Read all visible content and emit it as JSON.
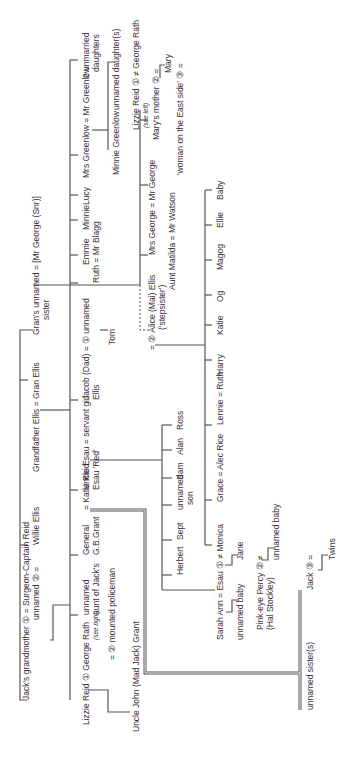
{
  "diagram": {
    "type": "family-tree",
    "orientation": "rotated -90deg (reads bottom to top)",
    "line_color": "#555555",
    "people": [
      {
        "id": "jacks_grandmother",
        "text": "Jack's grandmother ① = Surgeon-Captain Reid",
        "x": 22,
        "y": 700
      },
      {
        "id": "unnamed2",
        "text": "unnamed ② =",
        "x": 32,
        "y": 620
      },
      {
        "id": "willie",
        "text": "Willie Ellis",
        "x": 32,
        "y": 545
      },
      {
        "id": "grandfather",
        "text": "Grandfather Ellis = Gran Ellis",
        "x": 32,
        "y": 472
      },
      {
        "id": "grans_sister",
        "text": "Gran's unnamed = [Mr George (Snr)]",
        "x": 32,
        "y": 335
      },
      {
        "id": "grans_sister2",
        "text": "sister",
        "x": 42,
        "y": 320
      },
      {
        "id": "lizzie_reid",
        "text": "Lizzie Reid ① George Rath",
        "x": 82,
        "y": 725
      },
      {
        "id": "see_right",
        "text": "(see right)",
        "x": 92,
        "y": 640
      },
      {
        "id": "unnamed_aunt",
        "text": "unnamed",
        "x": 82,
        "y": 615
      },
      {
        "id": "unnamed_aunt2",
        "text": "aunt of Jack's",
        "x": 92,
        "y": 615
      },
      {
        "id": "general",
        "text": "General",
        "x": 82,
        "y": 555
      },
      {
        "id": "general2",
        "text": "G.B.Grant",
        "x": 92,
        "y": 555
      },
      {
        "id": "katie_reid",
        "text": "= Katie Reid",
        "x": 82,
        "y": 510
      },
      {
        "id": "uncle_esau",
        "text": "Uncle Esau = servant girl",
        "x": 82,
        "y": 490
      },
      {
        "id": "uncle_esau2",
        "text": "Esau 'Red'",
        "x": 92,
        "y": 490
      },
      {
        "id": "jacob",
        "text": "Jacob (Dad) = ① unnamed",
        "x": 82,
        "y": 400
      },
      {
        "id": "jacob2",
        "text": "Ellis",
        "x": 92,
        "y": 400
      },
      {
        "id": "ruth",
        "text": "Ruth = Mr Blagg",
        "x": 92,
        "y": 283
      },
      {
        "id": "emmie",
        "text": "Emmie",
        "x": 82,
        "y": 265
      },
      {
        "id": "minnie",
        "text": "Minnie",
        "x": 82,
        "y": 230
      },
      {
        "id": "lucy",
        "text": "Lucy",
        "x": 82,
        "y": 205
      },
      {
        "id": "mrs_greenlow",
        "text": "Mrs Greenlow = Mr Greenlow",
        "x": 82,
        "y": 178
      },
      {
        "id": "unmarried",
        "text": "2 unmarried",
        "x": 82,
        "y": 78
      },
      {
        "id": "unmarried2",
        "text": "daughters",
        "x": 92,
        "y": 72
      },
      {
        "id": "minnie_greenlow",
        "text": "Minnie Greenlow",
        "x": 112,
        "y": 175
      },
      {
        "id": "unnamed_daughters",
        "text": "unnamed daughter(s)",
        "x": 112,
        "y": 110
      },
      {
        "id": "mounted_policeman",
        "text": "= ② mounted policeman",
        "x": 108,
        "y": 660
      },
      {
        "id": "uncle_john",
        "text": "Uncle John (Mad Jack) Grant",
        "x": 132,
        "y": 732
      },
      {
        "id": "tom",
        "text": "Tom",
        "x": 108,
        "y": 345
      },
      {
        "id": "alice",
        "text": "= ② Alice (Mai) Ellis",
        "x": 148,
        "y": 350
      },
      {
        "id": "alice2",
        "text": "('stepsister')",
        "x": 158,
        "y": 330
      },
      {
        "id": "aunt_matilda",
        "text": "Aunt Matilda = Mr Watson",
        "x": 168,
        "y": 290
      },
      {
        "id": "mrs_george",
        "text": "Mrs George = Mr George",
        "x": 148,
        "y": 255
      },
      {
        "id": "lizzie_reid2",
        "text": "Lizzie Reid ① ≠ George Rath",
        "x": 132,
        "y": 130
      },
      {
        "id": "see_left",
        "text": "(see left)",
        "x": 142,
        "y": 128
      },
      {
        "id": "marys_mother",
        "text": "Mary's mother ② =",
        "x": 152,
        "y": 140
      },
      {
        "id": "mary",
        "text": "Mary",
        "x": 164,
        "y": 73
      },
      {
        "id": "woman_east",
        "text": "'woman on the East side' ③ =",
        "x": 176,
        "y": 175
      },
      {
        "id": "herbert",
        "text": "Herbert",
        "x": 176,
        "y": 575
      },
      {
        "id": "sept",
        "text": "Sept",
        "x": 176,
        "y": 540
      },
      {
        "id": "unnamed_son",
        "text": "unnamed",
        "x": 176,
        "y": 510
      },
      {
        "id": "unnamed_son2",
        "text": "son",
        "x": 186,
        "y": 505
      },
      {
        "id": "sam",
        "text": "Sam",
        "x": 176,
        "y": 480
      },
      {
        "id": "alan",
        "text": "Alan",
        "x": 176,
        "y": 455
      },
      {
        "id": "ross",
        "text": "Ross",
        "x": 176,
        "y": 430
      },
      {
        "id": "sarah_ann",
        "text": "Sarah Ann = Esau ① ≠ Monica",
        "x": 216,
        "y": 640
      },
      {
        "id": "unnamed_baby1",
        "text": "unnamed baby",
        "x": 236,
        "y": 640
      },
      {
        "id": "pink_eye",
        "text": "Pink-eye Percy ② ≠",
        "x": 256,
        "y": 630
      },
      {
        "id": "pink_eye2",
        "text": "(Hal Stockley)",
        "x": 266,
        "y": 630
      },
      {
        "id": "unnamed_baby2",
        "text": "unnamed baby",
        "x": 272,
        "y": 560
      },
      {
        "id": "jane",
        "text": "Jane",
        "x": 236,
        "y": 560
      },
      {
        "id": "grace",
        "text": "Grace = Alec Rice",
        "x": 216,
        "y": 502
      },
      {
        "id": "lennie",
        "text": "Lennie = Ruth",
        "x": 216,
        "y": 425
      },
      {
        "id": "harry",
        "text": "Harry",
        "x": 216,
        "y": 375
      },
      {
        "id": "katie",
        "text": "Katie",
        "x": 216,
        "y": 335
      },
      {
        "id": "og",
        "text": "Og",
        "x": 216,
        "y": 302
      },
      {
        "id": "magog",
        "text": "Magog",
        "x": 216,
        "y": 270
      },
      {
        "id": "ellie",
        "text": "Ellie",
        "x": 216,
        "y": 228
      },
      {
        "id": "baby",
        "text": "Baby",
        "x": 216,
        "y": 200
      },
      {
        "id": "jack",
        "text": "Jack ③ =",
        "x": 306,
        "y": 590
      },
      {
        "id": "twins",
        "text": "Twins",
        "x": 328,
        "y": 560
      },
      {
        "id": "unnamed_sisters",
        "text": "unnamed sister(s)",
        "x": 306,
        "y": 710
      }
    ]
  }
}
